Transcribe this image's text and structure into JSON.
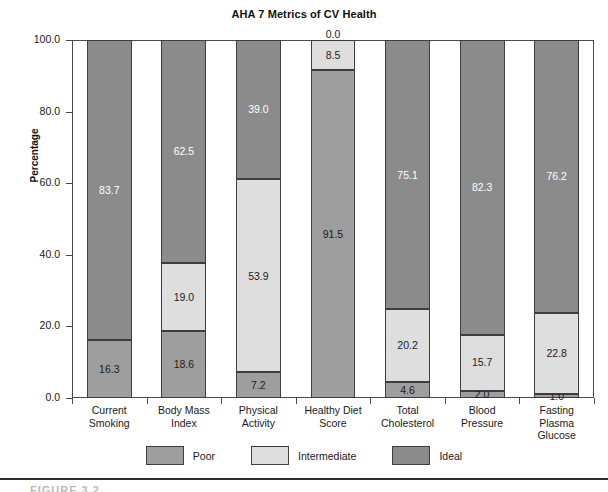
{
  "chart_data": {
    "type": "bar",
    "subtype": "stacked-bar-100",
    "title": "AHA 7 Metrics of CV Health",
    "xlabel": "",
    "ylabel": "Percentage",
    "ylim": [
      0,
      100
    ],
    "yticks": [
      "0.0",
      "20.0",
      "40.0",
      "60.0",
      "80.0",
      "100.0"
    ],
    "ytick_values": [
      0,
      20,
      40,
      60,
      80,
      100
    ],
    "grid": false,
    "legend_position": "bottom-center",
    "categories": [
      "Current Smoking",
      "Body Mass Index",
      "Physical Activity",
      "Healthy Diet Score",
      "Total Cholesterol",
      "Blood Pressure",
      "Fasting Plasma Glucose"
    ],
    "category_lines": [
      [
        "Current",
        "Smoking"
      ],
      [
        "Body Mass",
        "Index"
      ],
      [
        "Physical",
        "Activity"
      ],
      [
        "Healthy Diet",
        "Score"
      ],
      [
        "Total",
        "Cholesterol"
      ],
      [
        "Blood",
        "Pressure"
      ],
      [
        "Fasting",
        "Plasma",
        "Glucose"
      ]
    ],
    "series": [
      {
        "name": "Poor",
        "color": "#9e9e9e",
        "values": [
          16.3,
          18.6,
          7.2,
          91.5,
          4.6,
          2.0,
          1.0
        ]
      },
      {
        "name": "Intermediate",
        "color": "#dedede",
        "values": [
          0.0,
          19.0,
          53.9,
          8.5,
          20.2,
          15.7,
          22.8
        ]
      },
      {
        "name": "Ideal",
        "color": "#8b8b8b",
        "values": [
          83.7,
          62.5,
          39.0,
          0.0,
          75.1,
          82.3,
          76.2
        ]
      }
    ],
    "bars": [
      {
        "category": "Current Smoking",
        "segments": [
          {
            "series": "Poor",
            "value": 16.3,
            "label": "16.3",
            "show_label": true
          },
          {
            "series": "Intermediate",
            "value": 0.0,
            "label": "",
            "show_label": false
          },
          {
            "series": "Ideal",
            "value": 83.7,
            "label": "83.7",
            "show_label": true
          }
        ]
      },
      {
        "category": "Body Mass Index",
        "segments": [
          {
            "series": "Poor",
            "value": 18.6,
            "label": "18.6",
            "show_label": true
          },
          {
            "series": "Intermediate",
            "value": 19.0,
            "label": "19.0",
            "show_label": true
          },
          {
            "series": "Ideal",
            "value": 62.5,
            "label": "62.5",
            "show_label": true
          }
        ]
      },
      {
        "category": "Physical Activity",
        "segments": [
          {
            "series": "Poor",
            "value": 7.2,
            "label": "7.2",
            "show_label": true
          },
          {
            "series": "Intermediate",
            "value": 53.9,
            "label": "53.9",
            "show_label": true
          },
          {
            "series": "Ideal",
            "value": 39.0,
            "label": "39.0",
            "show_label": true
          }
        ]
      },
      {
        "category": "Healthy Diet Score",
        "segments": [
          {
            "series": "Poor",
            "value": 91.5,
            "label": "91.5",
            "show_label": true
          },
          {
            "series": "Intermediate",
            "value": 8.5,
            "label": "8.5",
            "show_label": true
          },
          {
            "series": "Ideal",
            "value": 0.0,
            "label": "0.0",
            "show_label": true,
            "zero": true
          }
        ]
      },
      {
        "category": "Total Cholesterol",
        "segments": [
          {
            "series": "Poor",
            "value": 4.6,
            "label": "4.6",
            "show_label": true
          },
          {
            "series": "Intermediate",
            "value": 20.2,
            "label": "20.2",
            "show_label": true
          },
          {
            "series": "Ideal",
            "value": 75.1,
            "label": "75.1",
            "show_label": true
          }
        ]
      },
      {
        "category": "Blood Pressure",
        "segments": [
          {
            "series": "Poor",
            "value": 2.0,
            "label": "2.0",
            "show_label": true
          },
          {
            "series": "Intermediate",
            "value": 15.7,
            "label": "15.7",
            "show_label": true
          },
          {
            "series": "Ideal",
            "value": 82.3,
            "label": "82.3",
            "show_label": true
          }
        ]
      },
      {
        "category": "Fasting Plasma Glucose",
        "segments": [
          {
            "series": "Poor",
            "value": 1.0,
            "label": "1.0",
            "show_label": true
          },
          {
            "series": "Intermediate",
            "value": 22.8,
            "label": "22.8",
            "show_label": true
          },
          {
            "series": "Ideal",
            "value": 76.2,
            "label": "76.2",
            "show_label": true
          }
        ]
      }
    ],
    "legend": [
      {
        "label": "Poor",
        "color": "#9e9e9e",
        "key": "poor"
      },
      {
        "label": "Intermediate",
        "color": "#dedede",
        "key": "inter"
      },
      {
        "label": "Ideal",
        "color": "#8b8b8b",
        "key": "ideal"
      }
    ]
  },
  "footer": {
    "caption": "FIGURE 3.2"
  }
}
